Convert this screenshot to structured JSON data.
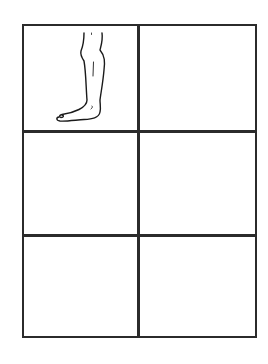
{
  "figure": {
    "grid": {
      "rows": 3,
      "columns": 2,
      "line_color": "#2b2b2b",
      "background": "#ffffff",
      "cells": [
        {
          "row": 1,
          "col": 1,
          "content": "leg-drawing"
        },
        {
          "row": 1,
          "col": 2,
          "content": ""
        },
        {
          "row": 2,
          "col": 1,
          "content": ""
        },
        {
          "row": 2,
          "col": 2,
          "content": ""
        },
        {
          "row": 3,
          "col": 1,
          "content": ""
        },
        {
          "row": 3,
          "col": 2,
          "content": ""
        }
      ]
    },
    "illustration": {
      "subject": "human lower leg and foot, side view, facing left",
      "stroke_color": "#1a1a1a"
    }
  }
}
